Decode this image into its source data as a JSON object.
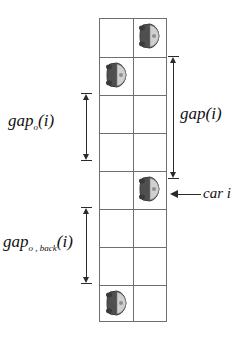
{
  "figure": {
    "road": {
      "lanes": 2,
      "rows": 8,
      "grid_color": "#6f6f6f",
      "left": 99,
      "top": 18,
      "width": 68,
      "height": 304,
      "row_height": 38,
      "lane_divider_x": 33,
      "row_line_offsets": [
        38,
        76,
        114,
        152,
        190,
        228,
        266
      ]
    },
    "cars": [
      {
        "name": "car-lane-right-row-0",
        "lane": "right",
        "row": 0,
        "x": 137,
        "y": 21
      },
      {
        "name": "car-lane-left-row-1",
        "lane": "left",
        "row": 1,
        "x": 104,
        "y": 60
      },
      {
        "name": "car-i",
        "lane": "right",
        "row": 4,
        "x": 137,
        "y": 174
      },
      {
        "name": "car-lane-left-row-7",
        "lane": "left",
        "row": 7,
        "x": 104,
        "y": 288
      }
    ],
    "measures": [
      {
        "name": "gap-o-measure",
        "label_id": "label-gap-o",
        "base": "gap",
        "subscript": "o",
        "argument": "(i)",
        "side": "left",
        "x": 81,
        "top": 93,
        "height": 68
      },
      {
        "name": "gap-o-back-measure",
        "label_id": "label-gap-back",
        "base": "gap",
        "subscript": "o , back",
        "argument": "(i)",
        "side": "left",
        "x": 81,
        "top": 207,
        "height": 77
      },
      {
        "name": "gap-measure",
        "label_id": "label-gap",
        "base": "gap",
        "subscript": "",
        "argument": "(i)",
        "side": "right",
        "x": 168,
        "top": 56,
        "height": 123
      }
    ],
    "annotations": [
      {
        "name": "car-i-callout",
        "text": "car i",
        "arrow_direction": "left",
        "target": "car-i"
      }
    ],
    "colors": {
      "grid": "#6f6f6f",
      "measure": "#2a2a2a",
      "car_body": "#4f4f4f",
      "car_body_dark": "#3a3a3a",
      "car_window": "#d4d4d4",
      "background": "#ffffff",
      "text": "#111111"
    }
  }
}
